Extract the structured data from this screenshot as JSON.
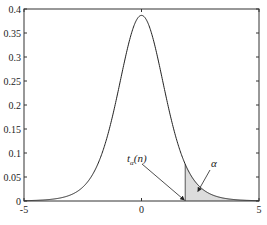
{
  "chart_data": {
    "type": "area",
    "title": "",
    "xlabel": "",
    "ylabel": "",
    "distribution": "Student t density",
    "degrees_of_freedom": 8,
    "xlim": [
      -5,
      5
    ],
    "ylim": [
      0,
      0.4
    ],
    "x_ticks": [
      -5,
      0,
      5
    ],
    "x_tick_labels": [
      "-5",
      "0",
      "5"
    ],
    "y_ticks": [
      0,
      0.05,
      0.1,
      0.15,
      0.2,
      0.25,
      0.3,
      0.35,
      0.4
    ],
    "y_tick_labels": [
      "0",
      "0.05",
      "0.1",
      "0.15",
      "0.2",
      "0.25",
      "0.3",
      "0.35",
      "0.4"
    ],
    "grid": false,
    "peak": {
      "x": 0,
      "y": 0.385
    },
    "shaded_region": {
      "from_x": 1.86,
      "to_x": 5,
      "fill": "#dcdcdc",
      "meaning": "upper tail area alpha"
    },
    "annotations": [
      {
        "text_main": "t",
        "text_sub": "α",
        "text_suffix": "(n)",
        "points_to_x": 1.86,
        "points_to_y": 0
      },
      {
        "text_main": "α",
        "points_to_x": 2.4,
        "points_to_y": 0.02
      }
    ],
    "colors": {
      "line": "#222222",
      "shade": "#dcdcdc",
      "axes": "#333333"
    }
  }
}
